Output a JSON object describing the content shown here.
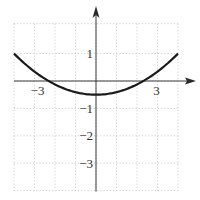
{
  "chart_data": {
    "type": "line",
    "title": "",
    "xlabel": "",
    "ylabel": "",
    "xlim": [
      -4,
      4
    ],
    "ylim": [
      -4,
      2
    ],
    "grid": true,
    "grid_step": 1,
    "x_ticks": [
      {
        "value": -3,
        "label": "−3"
      },
      {
        "value": 3,
        "label": "3"
      }
    ],
    "y_ticks": [
      {
        "value": 1,
        "label": "1"
      },
      {
        "value": -1,
        "label": "−1"
      },
      {
        "value": -2,
        "label": "−2"
      },
      {
        "value": -3,
        "label": "−3"
      }
    ],
    "series": [
      {
        "name": "f(x)",
        "function": "(3/32)x^2 - 1/2",
        "x": [
          -4,
          -3,
          -2.31,
          -2,
          -1,
          0,
          1,
          2,
          2.31,
          3,
          4
        ],
        "y": [
          1,
          0.344,
          0,
          -0.125,
          -0.406,
          -0.5,
          -0.406,
          -0.125,
          0,
          0.344,
          1
        ]
      }
    ],
    "colors": {
      "curve": "#1a1a1a",
      "axis": "#3a3a3a",
      "grid": "#b8b8b8"
    }
  }
}
